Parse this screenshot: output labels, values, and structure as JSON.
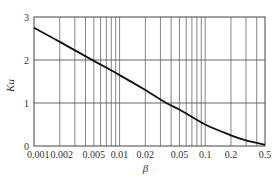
{
  "chart_data": {
    "type": "line",
    "title": "",
    "xlabel": "β",
    "ylabel": "Ku",
    "xscale": "log",
    "xlim": [
      0.001,
      0.5
    ],
    "ylim": [
      0,
      3
    ],
    "grid": true,
    "legend": null,
    "x_ticks": [
      0.001,
      0.002,
      0.005,
      0.01,
      0.02,
      0.05,
      0.1,
      0.2,
      0.5
    ],
    "x_tick_labels": [
      "0.001",
      "0.002",
      "0.005",
      "0.01",
      "0.02",
      "0.05",
      "0.1",
      "0.2",
      "0.5"
    ],
    "x_minor_gridlines": [
      0.003,
      0.004,
      0.006,
      0.007,
      0.008,
      0.009,
      0.03,
      0.04,
      0.06,
      0.07,
      0.08,
      0.09,
      0.3,
      0.4
    ],
    "y_ticks": [
      0,
      1,
      2,
      3
    ],
    "y_tick_labels": [
      "0",
      "1",
      "2",
      "3"
    ],
    "series": [
      {
        "name": "Ku",
        "x": [
          0.001,
          0.002,
          0.005,
          0.01,
          0.02,
          0.035,
          0.05,
          0.1,
          0.2,
          0.3,
          0.5
        ],
        "values": [
          2.75,
          2.42,
          1.98,
          1.65,
          1.3,
          1.0,
          0.85,
          0.5,
          0.25,
          0.13,
          0.03
        ]
      }
    ]
  }
}
